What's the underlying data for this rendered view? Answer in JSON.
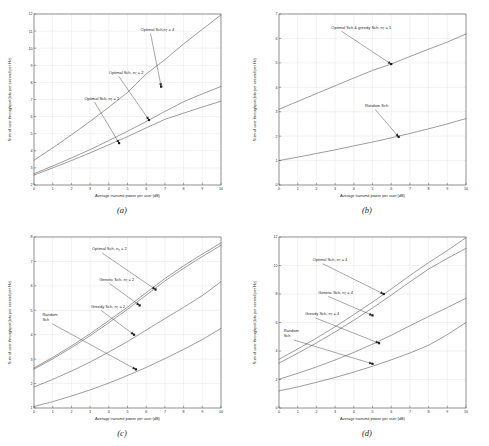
{
  "figure": {
    "panel_count": 4,
    "axis_label_x": "Average transmit power per user (dB)",
    "axis_label_y": "Sum of user throughput (bits per second per Hz)"
  },
  "captions": {
    "a": "(a)",
    "b": "(b)",
    "c": "(c)",
    "d": "(d)"
  },
  "chart_data": [
    {
      "type": "line",
      "panel": "a",
      "title": "",
      "xlabel": "Average transmit power per user (dB)",
      "ylabel": "Sum of user throughput (bits per second per Hz)",
      "xlim": [
        0,
        10
      ],
      "ylim": [
        2,
        12
      ],
      "xticks": [
        0,
        1,
        2,
        3,
        4,
        5,
        6,
        7,
        8,
        9,
        10
      ],
      "yticks": [
        2,
        3,
        4,
        5,
        6,
        7,
        8,
        9,
        10,
        11,
        12
      ],
      "grid": true,
      "legend_position": "annotations",
      "x": [
        0,
        1,
        2,
        3,
        4,
        5,
        6,
        7,
        8,
        9,
        10
      ],
      "series": [
        {
          "name": "Optimal Sch, nT = 4",
          "values": [
            3.45,
            4.17,
            4.93,
            5.72,
            6.55,
            7.41,
            8.49,
            9.33,
            10.25,
            11.1,
            11.95
          ]
        },
        {
          "name": "Optimal Sch, nT = 2",
          "values": [
            2.66,
            3.11,
            3.58,
            4.07,
            4.6,
            5.14,
            5.71,
            6.3,
            6.87,
            7.33,
            7.76
          ]
        },
        {
          "name": "Optimal Sch, nT = 1",
          "values": [
            2.58,
            3.0,
            3.43,
            3.88,
            4.35,
            4.83,
            5.34,
            5.84,
            6.2,
            6.56,
            6.9
          ]
        }
      ],
      "annotations": [
        {
          "text": "Optimal Sch,n",
          "sub": "T",
          "tail": "= 4",
          "x": 5.7,
          "y": 11.0,
          "point_x": 6.8,
          "point_y": 7.75
        },
        {
          "text": "Optimal Sch, n",
          "sub": "T",
          "tail": "= 2",
          "x": 4.0,
          "y": 8.5,
          "point_x": 6.15,
          "point_y": 5.8
        },
        {
          "text": "Optimal Sch, n",
          "sub": "T",
          "tail": "= 1",
          "x": 2.7,
          "y": 7.0,
          "point_x": 4.55,
          "point_y": 4.45
        }
      ]
    },
    {
      "type": "line",
      "panel": "b",
      "title": "",
      "xlabel": "Average transmit power per user (dB)",
      "ylabel": "Sum of user throughput (bits per second per Hz)",
      "xlim": [
        0,
        10
      ],
      "ylim": [
        0,
        7
      ],
      "xticks": [
        0,
        1,
        2,
        3,
        4,
        5,
        6,
        7,
        8,
        9,
        10
      ],
      "yticks": [
        0,
        1,
        2,
        3,
        4,
        5,
        6,
        7
      ],
      "grid": true,
      "legend_position": "annotations",
      "x": [
        0,
        1,
        2,
        3,
        4,
        5,
        6,
        7,
        8,
        9,
        10
      ],
      "series": [
        {
          "name": "Optimal Sch & greedy Sch, nT = 1",
          "values": [
            3.1,
            3.42,
            3.74,
            4.06,
            4.38,
            4.69,
            4.95,
            5.26,
            5.56,
            5.85,
            6.18
          ]
        },
        {
          "name": "Random Sch",
          "values": [
            1.0,
            1.14,
            1.29,
            1.44,
            1.6,
            1.76,
            1.93,
            2.11,
            2.3,
            2.5,
            2.72
          ]
        }
      ],
      "annotations": [
        {
          "text": "Optimal Sch & greedy Sch, n",
          "sub": "T",
          "tail": "= 1",
          "x": 2.8,
          "y": 6.4,
          "point_x": 6.0,
          "point_y": 4.95
        },
        {
          "text": "Random Sch",
          "sub": "",
          "tail": "",
          "x": 4.6,
          "y": 3.2,
          "point_x": 6.4,
          "point_y": 1.97
        }
      ]
    },
    {
      "type": "line",
      "panel": "c",
      "title": "",
      "xlabel": "Average transmit power per user (dB)",
      "ylabel": "Sum of user throughput (bits per second per Hz)",
      "xlim": [
        0,
        10
      ],
      "ylim": [
        1,
        8
      ],
      "xticks": [
        0,
        1,
        2,
        3,
        4,
        5,
        6,
        7,
        8,
        9,
        10
      ],
      "yticks": [
        1,
        2,
        3,
        4,
        5,
        6,
        7,
        8
      ],
      "grid": true,
      "legend_position": "annotations",
      "x": [
        0,
        1,
        2,
        3,
        4,
        5,
        6,
        7,
        8,
        9,
        10
      ],
      "series": [
        {
          "name": "Optimal Sch, nT = 2",
          "values": [
            2.64,
            3.07,
            3.54,
            4.04,
            4.58,
            5.13,
            5.72,
            6.3,
            6.82,
            7.3,
            7.76
          ]
        },
        {
          "name": "Genetic Sch, nT = 2",
          "values": [
            2.59,
            3.01,
            3.47,
            3.96,
            4.49,
            5.04,
            5.62,
            6.2,
            6.72,
            7.2,
            7.66
          ]
        },
        {
          "name": "Greedy Sch, nT = 2",
          "values": [
            1.86,
            2.17,
            2.51,
            2.88,
            3.29,
            3.72,
            4.19,
            4.66,
            5.12,
            5.6,
            6.17
          ]
        },
        {
          "name": "Random Sch",
          "values": [
            1.06,
            1.26,
            1.49,
            1.74,
            2.02,
            2.33,
            2.66,
            3.02,
            3.4,
            3.8,
            4.26
          ]
        }
      ],
      "annotations": [
        {
          "text": "Optimal Sch, n",
          "sub": "T",
          "tail": "= 2",
          "x": 3.1,
          "y": 7.45,
          "point_x": 6.5,
          "point_y": 5.85
        },
        {
          "text": "Genetic Sch, n",
          "sub": "T",
          "tail": "= 2",
          "x": 3.5,
          "y": 6.2,
          "point_x": 5.65,
          "point_y": 5.2
        },
        {
          "text": "Greedy Sch, n",
          "sub": "T",
          "tail": "= 2",
          "x": 3.05,
          "y": 5.1,
          "point_x": 5.35,
          "point_y": 4.0
        },
        {
          "text": "Random",
          "sub": "",
          "tail": "Sch",
          "x": 0.45,
          "y": 4.75,
          "point_x": 5.45,
          "point_y": 2.58
        }
      ]
    },
    {
      "type": "line",
      "panel": "d",
      "title": "",
      "xlabel": "Average transmit power per user (dB)",
      "ylabel": "Sum of user throughput (bits per second per Hz)",
      "xlim": [
        0,
        10
      ],
      "ylim": [
        0,
        12
      ],
      "xticks": [
        0,
        1,
        2,
        3,
        4,
        5,
        6,
        7,
        8,
        9,
        10
      ],
      "yticks": [
        0,
        2,
        4,
        6,
        8,
        10,
        12
      ],
      "grid": true,
      "legend_position": "annotations",
      "x": [
        0,
        1,
        2,
        3,
        4,
        5,
        6,
        7,
        8,
        9,
        10
      ],
      "series": [
        {
          "name": "Optimal Sch, nT = 4",
          "values": [
            3.42,
            4.14,
            4.9,
            5.7,
            6.55,
            7.43,
            8.35,
            9.3,
            10.2,
            11.05,
            11.95
          ]
        },
        {
          "name": "Genetic Sch, nT = 4",
          "values": [
            3.15,
            3.84,
            4.57,
            5.34,
            6.16,
            7.02,
            7.92,
            8.85,
            9.75,
            10.5,
            11.2
          ]
        },
        {
          "name": "Greedy Sch, nT = 4",
          "values": [
            2.02,
            2.43,
            2.88,
            3.37,
            3.9,
            4.48,
            5.1,
            5.77,
            6.42,
            7.05,
            7.7
          ]
        },
        {
          "name": "Random Sch",
          "values": [
            1.2,
            1.48,
            1.8,
            2.14,
            2.52,
            2.93,
            3.38,
            3.86,
            4.4,
            5.15,
            6.0
          ]
        }
      ],
      "annotations": [
        {
          "text": "Optimal Sch, n",
          "sub": "T",
          "tail": "= 4",
          "x": 1.8,
          "y": 10.3,
          "point_x": 5.6,
          "point_y": 8.0
        },
        {
          "text": "Genetic Sch, n",
          "sub": "T",
          "tail": "= 4",
          "x": 2.1,
          "y": 8.0,
          "point_x": 5.0,
          "point_y": 6.5
        },
        {
          "text": "Greedy Sch, n",
          "sub": "T",
          "tail": "= 4",
          "x": 1.4,
          "y": 6.5,
          "point_x": 5.35,
          "point_y": 4.55
        },
        {
          "text": "Random",
          "sub": "",
          "tail": "Sch",
          "x": 0.25,
          "y": 5.3,
          "point_x": 5.0,
          "point_y": 3.1
        }
      ]
    }
  ]
}
